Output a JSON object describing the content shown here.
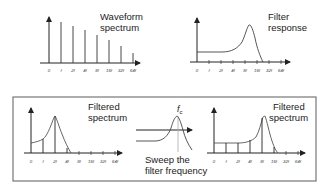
{
  "panels": {
    "waveform": {
      "title_line1": "Waveform",
      "title_line2": "spectrum",
      "ticks": [
        "0",
        "f",
        "2f",
        "4f",
        "8f",
        "16f",
        "32f",
        "64f"
      ]
    },
    "filter": {
      "title_line1": "Filter",
      "title_line2": "response",
      "ticks": [
        "0",
        "f",
        "2f",
        "4f",
        "8f",
        "16f",
        "32f",
        "64f"
      ]
    },
    "filtered_low": {
      "title_line1": "Filtered",
      "title_line2": "spectrum",
      "ticks": [
        "0",
        "f",
        "2f",
        "4f",
        "8f",
        "16f",
        "32f",
        "64f"
      ]
    },
    "sweep": {
      "cutoff_label": "f",
      "cutoff_sub": "c",
      "caption_line1": "Sweep the",
      "caption_line2": "filter frequency"
    },
    "filtered_high": {
      "title_line1": "Filtered",
      "title_line2": "spectrum",
      "ticks": [
        "0",
        "f",
        "2f",
        "4f",
        "8f",
        "16f",
        "32f",
        "64f"
      ]
    }
  },
  "colors": {
    "line": "#222222",
    "curve": "#555555",
    "box": "#777777"
  }
}
